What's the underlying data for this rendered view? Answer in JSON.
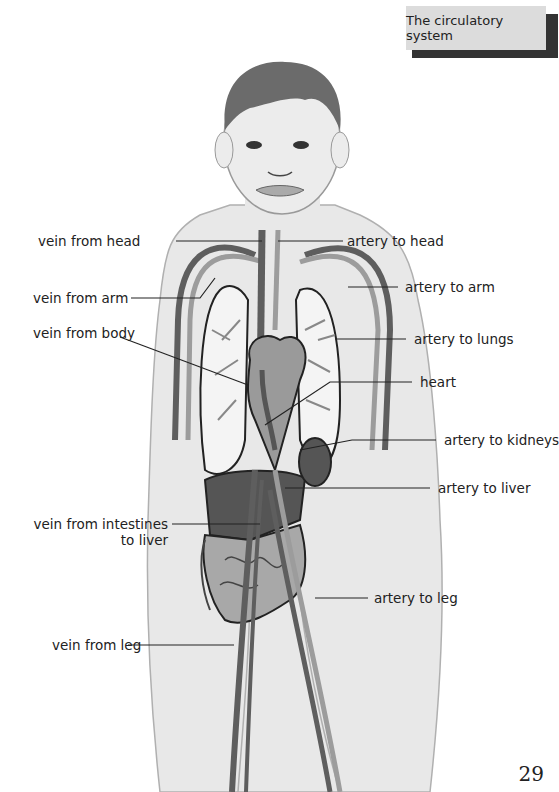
{
  "header": {
    "title": "The circulatory system"
  },
  "page_number": "29",
  "labels": {
    "vein_from_head": "vein from head",
    "vein_from_arm": "vein from arm",
    "vein_from_body": "vein from body",
    "vein_from_intestines_line1": "vein from intestines",
    "vein_from_intestines_line2": "to liver",
    "vein_from_leg": "vein from leg",
    "artery_to_head": "artery to head",
    "artery_to_arm": "artery to arm",
    "artery_to_lungs": "artery to lungs",
    "heart": "heart",
    "artery_to_kidneys": "artery to kidneys",
    "artery_to_liver": "artery to liver",
    "artery_to_leg": "artery to leg"
  },
  "colors": {
    "vein": "#5e5e5e",
    "artery": "#9c9c9c",
    "skin": "#e8e8e8",
    "organ_dark": "#555555",
    "organ_mid": "#9a9a9a",
    "hair": "#6b6b6b"
  }
}
